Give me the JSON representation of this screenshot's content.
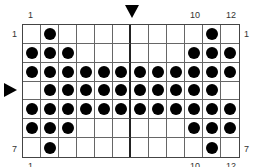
{
  "chart": {
    "columns": 12,
    "rows": 7,
    "top_labels": {
      "left": "1",
      "col10": "10",
      "col12": "12"
    },
    "bottom_labels": {
      "left": "1",
      "col10": "10",
      "col12": "12"
    },
    "left_labels": {
      "row1": "1",
      "row7": "7"
    },
    "right_labels": {
      "row1": "1",
      "row7": "7"
    },
    "markers": {
      "top_arrow": "center column marker",
      "left_arrow": "center row marker (row 4)"
    },
    "grid": [
      [
        0,
        1,
        0,
        0,
        0,
        0,
        0,
        0,
        0,
        0,
        1,
        0
      ],
      [
        1,
        1,
        1,
        0,
        0,
        0,
        0,
        0,
        0,
        1,
        1,
        1
      ],
      [
        1,
        1,
        1,
        1,
        1,
        1,
        1,
        1,
        1,
        1,
        1,
        1
      ],
      [
        0,
        1,
        1,
        1,
        1,
        1,
        1,
        1,
        1,
        1,
        1,
        0
      ],
      [
        1,
        1,
        1,
        1,
        1,
        1,
        1,
        1,
        1,
        1,
        1,
        1
      ],
      [
        1,
        1,
        1,
        0,
        0,
        0,
        0,
        0,
        0,
        1,
        1,
        1
      ],
      [
        0,
        1,
        0,
        0,
        0,
        0,
        0,
        0,
        0,
        0,
        1,
        0
      ]
    ],
    "colors": {
      "dot": "#000000",
      "grid_line": "#666666",
      "background": "#ffffff"
    }
  }
}
